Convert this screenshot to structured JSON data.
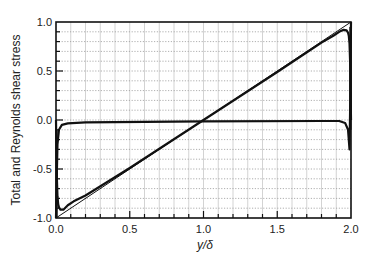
{
  "chart_data": {
    "type": "line",
    "title": "",
    "xlabel": "y/δ",
    "ylabel": "Total and Reynolds shear stress",
    "xlim": [
      0.0,
      2.0
    ],
    "ylim": [
      -1.0,
      1.0
    ],
    "x_ticks": [
      "0.0",
      "0.5",
      "1.0",
      "1.5",
      "2.0"
    ],
    "y_ticks": [
      "-1.0",
      "-0.5",
      "0.0",
      "0.5",
      "1.0"
    ],
    "x_tick_values": [
      0.0,
      0.5,
      1.0,
      1.5,
      2.0
    ],
    "y_tick_values": [
      -1.0,
      -0.5,
      0.0,
      0.5,
      1.0
    ],
    "grid": {
      "on": true,
      "x_minor_step": 0.1,
      "y_minor_step": 0.1
    },
    "legend": null,
    "series": [
      {
        "name": "Total shear stress",
        "style": "thin solid line",
        "x": [
          0.0,
          2.0
        ],
        "y": [
          -1.0,
          1.0
        ]
      },
      {
        "name": "Reynolds shear stress (symmetric-in-time loop)",
        "style": "thick solid line",
        "x": [
          0.0,
          0.005,
          0.01,
          0.015,
          0.02,
          0.03,
          0.05,
          0.08,
          0.12,
          0.2,
          0.5,
          1.0,
          1.5,
          1.8,
          1.88,
          1.92,
          1.95,
          1.97,
          1.98,
          1.985,
          1.99,
          1.995,
          2.0
        ],
        "y": [
          0.0,
          -0.55,
          -0.78,
          -0.86,
          -0.89,
          -0.915,
          -0.915,
          -0.87,
          -0.83,
          -0.77,
          -0.49,
          0.0,
          0.49,
          0.79,
          0.86,
          0.9,
          0.92,
          0.915,
          0.89,
          0.86,
          0.78,
          0.55,
          0.0
        ]
      },
      {
        "name": "Reynolds shear stress (return branch)",
        "style": "thick solid line",
        "x": [
          0.0,
          0.005,
          0.01,
          0.015,
          0.02,
          0.03,
          0.05,
          0.08,
          0.12,
          0.2,
          0.5,
          1.0,
          1.5,
          1.8,
          1.88,
          1.92,
          1.95,
          1.97,
          1.98,
          1.985,
          1.99,
          1.995,
          2.0
        ],
        "y": [
          0.0,
          -0.55,
          -0.78,
          -0.86,
          -0.89,
          -0.915,
          -0.915,
          -0.87,
          -0.83,
          -0.77,
          -0.49,
          0.0,
          0.49,
          0.79,
          0.86,
          0.9,
          0.92,
          0.915,
          0.89,
          0.86,
          0.78,
          0.55,
          0.0
        ]
      },
      {
        "name": "Near-wall Reynolds stress profile (flat branch)",
        "style": "thick solid line",
        "x": [
          0.0,
          0.01,
          0.02,
          0.03,
          0.05,
          0.08,
          0.12,
          0.2,
          0.5,
          1.0,
          1.5,
          1.8,
          1.88,
          1.92,
          1.95,
          1.97,
          1.98,
          1.99,
          2.0
        ],
        "y": [
          -1.0,
          -0.6,
          -0.25,
          -0.1,
          -0.05,
          -0.035,
          -0.03,
          -0.025,
          -0.02,
          -0.015,
          -0.01,
          -0.01,
          -0.01,
          -0.015,
          -0.03,
          -0.08,
          -0.2,
          -0.5,
          1.0
        ]
      }
    ]
  }
}
